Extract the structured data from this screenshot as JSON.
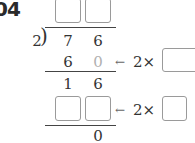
{
  "question_number": "04",
  "division": {
    "divisor": "2",
    "bracket": ")",
    "dividend": [
      "7",
      "6"
    ],
    "quotient_boxes": [
      "",
      ""
    ],
    "step1_product": [
      "6",
      "0"
    ],
    "step1_remainder": [
      "1",
      "6"
    ],
    "step2_product_boxes": [
      "",
      ""
    ],
    "final_remainder": "0"
  },
  "annotations": [
    {
      "arrow": "←",
      "text": "2×",
      "box": ""
    },
    {
      "arrow": "←",
      "text": "2×",
      "box": ""
    }
  ],
  "colors": {
    "box_border": "#9a9a9a",
    "hint_digit": "#b0b0b0",
    "text": "#333333"
  }
}
